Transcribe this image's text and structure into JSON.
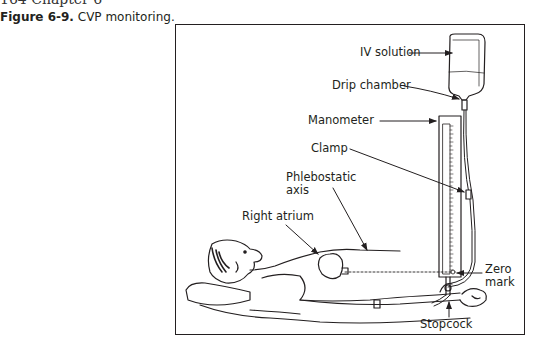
{
  "page": {
    "header": "164   Chapter 6"
  },
  "figure": {
    "number": "Figure 6-9.",
    "caption": "CVP monitoring.",
    "labels": {
      "iv_solution": "IV solution",
      "drip_chamber": "Drip chamber",
      "manometer": "Manometer",
      "clamp": "Clamp",
      "phlebostatic_line1": "Phlebostatic",
      "phlebostatic_line2": "axis",
      "right_atrium": "Right atrium",
      "zero_line1": "Zero",
      "zero_line2": "mark",
      "stopcock": "Stopcock"
    },
    "colors": {
      "ink": "#231f20",
      "border": "#231f20",
      "background": "#ffffff"
    }
  }
}
